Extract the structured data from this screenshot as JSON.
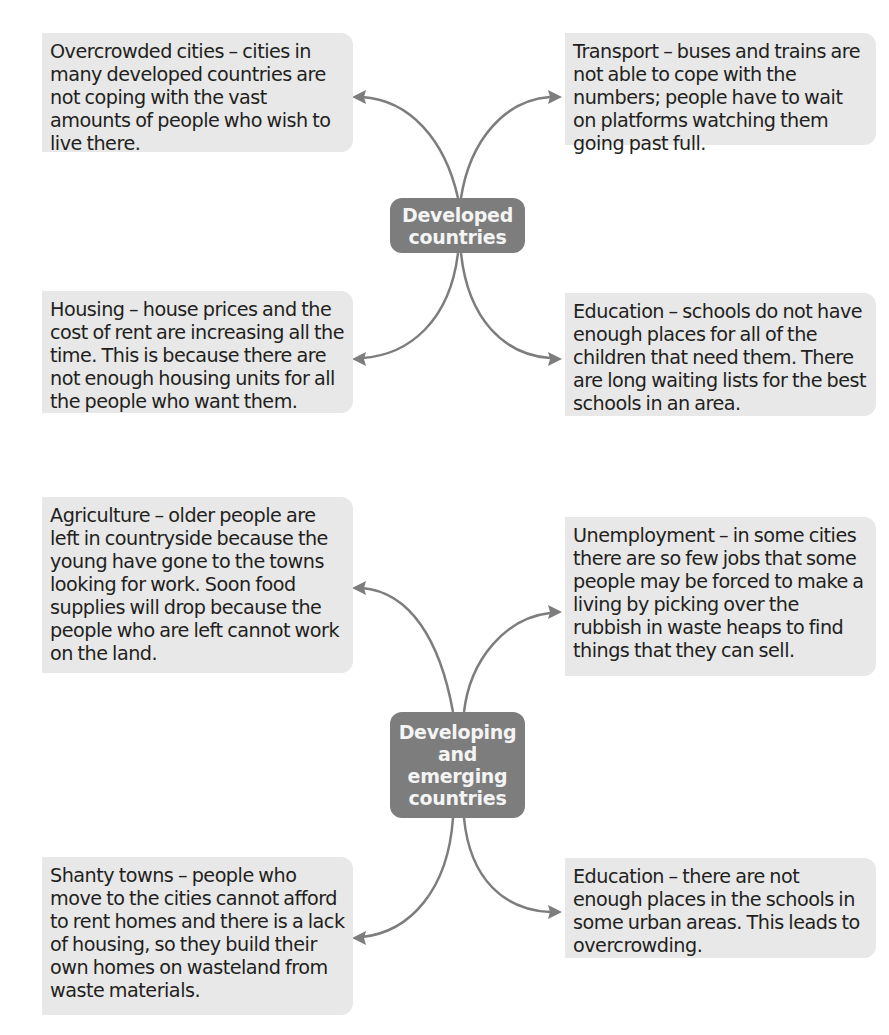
{
  "diagram": {
    "type": "mind-map",
    "colors": {
      "node_fill": "#7d7d7d",
      "node_text": "#f4f4f4",
      "box_fill": "#e8e8e8",
      "box_text": "#231f20",
      "connector": "#7d7d7d"
    },
    "groups": [
      {
        "node": {
          "label": "Developed countries",
          "lines": [
            "Developed",
            "countries"
          ]
        },
        "boxes": [
          {
            "position": "top-left",
            "text": "Overcrowded cities – cities in many developed countries are not coping with the vast amounts of people who wish to live there."
          },
          {
            "position": "top-right",
            "text": "Transport – buses and trains are not able to cope with the numbers; people have to wait on platforms watching them going past full."
          },
          {
            "position": "bottom-left",
            "text": "Housing – house prices and the cost of rent are increasing all the time. This is because there are not enough housing units for all the people who want them."
          },
          {
            "position": "bottom-right",
            "text": "Education – schools do not have enough places for all of the children that need them. There are long waiting lists for the best schools in an area."
          }
        ]
      },
      {
        "node": {
          "label": "Developing and emerging countries",
          "lines": [
            "Developing",
            "and",
            "emerging",
            "countries"
          ]
        },
        "boxes": [
          {
            "position": "top-left",
            "text": "Agriculture – older people are left in countryside because the young have gone to the towns looking for work. Soon food supplies will drop because the people who are left cannot work on the land."
          },
          {
            "position": "top-right",
            "text": "Unemployment – in some cities there are so few jobs that some people may be forced to make a living by picking over the rubbish in waste heaps to find things that they can sell."
          },
          {
            "position": "bottom-left",
            "text": "Shanty towns – people who move to the cities cannot afford to rent homes and there is a lack of housing, so they build their own homes on wasteland from waste materials."
          },
          {
            "position": "bottom-right",
            "text": "Education – there are not enough places in the schools in some urban areas. This leads to overcrowding."
          }
        ]
      }
    ]
  }
}
